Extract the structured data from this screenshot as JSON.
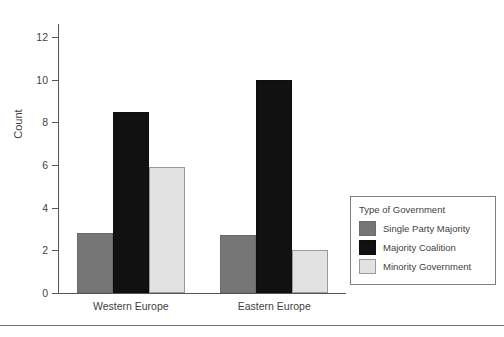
{
  "chart_data": {
    "type": "bar",
    "title": "",
    "xlabel": "",
    "ylabel": "Count",
    "ylim": [
      0,
      12.6
    ],
    "yticks": [
      0,
      2,
      4,
      6,
      8,
      10,
      12
    ],
    "ytick_labels": [
      "0",
      "2",
      "4",
      "6",
      "8",
      "10",
      "12"
    ],
    "grid": false,
    "categories": [
      "Western Europe",
      "Eastern Europe"
    ],
    "legend_title": "Type of Government",
    "legend_position": "bottom-right",
    "series": [
      {
        "name": "Single Party Majority",
        "color": "#767676",
        "values": [
          2.8,
          2.7
        ]
      },
      {
        "name": "Majority Coalition",
        "color": "#111111",
        "values": [
          8.5,
          10.0
        ]
      },
      {
        "name": "Minority Government",
        "color": "#e2e2e2",
        "values": [
          5.9,
          2.0
        ]
      }
    ]
  }
}
